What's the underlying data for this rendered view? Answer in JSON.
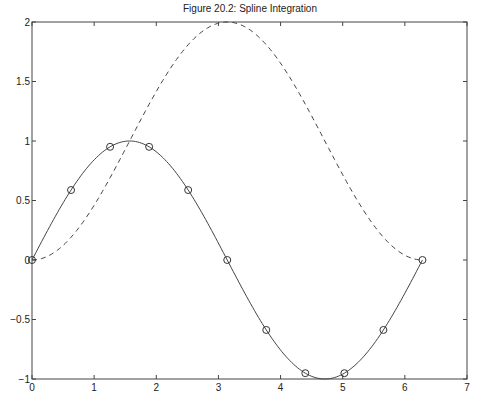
{
  "chart_data": {
    "type": "line",
    "title": "Figure 20.2: Spline Integration",
    "xlabel": "",
    "ylabel": "",
    "xlim": [
      0,
      7
    ],
    "ylim": [
      -1,
      2
    ],
    "grid": false,
    "legend": null,
    "x_ticks": [
      "0",
      "1",
      "2",
      "3",
      "4",
      "5",
      "6",
      "7"
    ],
    "y_ticks": [
      "-1",
      "-0.5",
      "0",
      "0.5",
      "1",
      "1.5",
      "2"
    ],
    "series": [
      {
        "name": "sin(x) spline",
        "style": "solid",
        "function": "sin(x)",
        "x_range": [
          0,
          6.2832
        ]
      },
      {
        "name": "sin(x) data points",
        "style": "markers-circle",
        "x": [
          0,
          0.6283,
          1.2566,
          1.885,
          2.5133,
          3.1416,
          3.7699,
          4.3982,
          5.0265,
          5.6549,
          6.2832
        ],
        "y": [
          0,
          0.5878,
          0.9511,
          0.9511,
          0.5878,
          0,
          -0.5878,
          -0.9511,
          -0.9511,
          -0.5878,
          0
        ]
      },
      {
        "name": "integral of spline (1 - cos x)",
        "style": "dashed",
        "function": "1 - cos(x)",
        "x_range": [
          0,
          6.2832
        ],
        "x": [
          0,
          1.5708,
          3.1416,
          4.7124,
          6.2832
        ],
        "y": [
          0,
          1,
          2,
          1,
          0
        ]
      }
    ]
  }
}
